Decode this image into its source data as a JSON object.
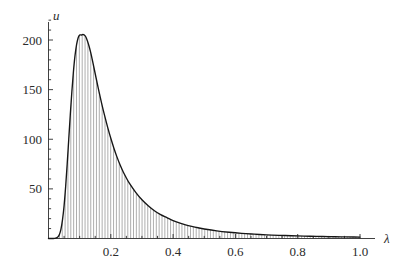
{
  "chart_data": {
    "type": "area",
    "title": "",
    "subtitle": "",
    "xlabel": "λ",
    "ylabel": "u",
    "xlim": [
      0,
      1.04
    ],
    "ylim": [
      0,
      228
    ],
    "grid": false,
    "legend": null,
    "annotations": [],
    "fill_style": "vertical-hatch",
    "xticks": [
      0.2,
      0.4,
      0.6,
      0.8,
      1.0
    ],
    "xtick_labels": [
      "0.2",
      "0.4",
      "0.6",
      "0.8",
      "1.0"
    ],
    "yticks": [
      50,
      100,
      150,
      200
    ],
    "ytick_labels": [
      "50",
      "100",
      "150",
      "200"
    ],
    "x_minor_tick_step": 0.05,
    "y_minor_tick_step": 10,
    "peak": {
      "x": 0.115,
      "y": 205
    },
    "x": [
      0.0,
      0.01,
      0.02,
      0.03,
      0.035,
      0.04,
      0.045,
      0.05,
      0.055,
      0.06,
      0.065,
      0.07,
      0.075,
      0.08,
      0.085,
      0.09,
      0.095,
      0.1,
      0.105,
      0.11,
      0.115,
      0.12,
      0.125,
      0.13,
      0.135,
      0.14,
      0.15,
      0.16,
      0.17,
      0.18,
      0.19,
      0.2,
      0.21,
      0.22,
      0.23,
      0.24,
      0.25,
      0.26,
      0.28,
      0.3,
      0.32,
      0.34,
      0.36,
      0.38,
      0.4,
      0.42,
      0.44,
      0.46,
      0.48,
      0.5,
      0.54,
      0.58,
      0.62,
      0.66,
      0.7,
      0.74,
      0.78,
      0.82,
      0.86,
      0.9,
      0.94,
      0.98,
      1.0
    ],
    "y": [
      0.0,
      0.0,
      0.1,
      1.5,
      4.0,
      9.5,
      19.0,
      33.0,
      52.0,
      75.0,
      100.0,
      125.0,
      148.0,
      168.0,
      184.0,
      195.0,
      202.0,
      205.0,
      205.0,
      205.5,
      205.0,
      203.0,
      199.0,
      194.0,
      188.0,
      181.0,
      166.0,
      151.0,
      137.0,
      124.0,
      112.0,
      101.0,
      91.0,
      82.0,
      74.0,
      67.0,
      61.0,
      55.5,
      46.5,
      39.0,
      33.0,
      28.0,
      24.0,
      21.0,
      18.0,
      15.8,
      13.8,
      12.2,
      10.8,
      9.6,
      7.7,
      6.3,
      5.2,
      4.4,
      3.7,
      3.2,
      2.8,
      2.4,
      2.1,
      1.9,
      1.7,
      1.5,
      1.4
    ]
  },
  "axes": {
    "y_axis_name": "u",
    "x_axis_name": "λ"
  }
}
